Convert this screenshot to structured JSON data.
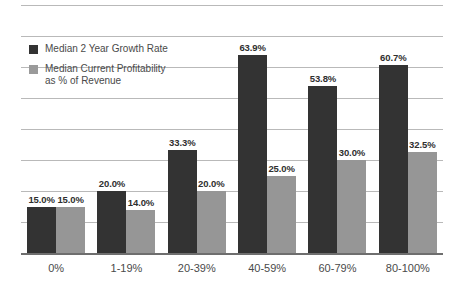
{
  "chart_data": {
    "type": "bar",
    "title": "",
    "subtitle": "",
    "xlabel": "",
    "ylabel": "",
    "ylim": [
      0,
      80
    ],
    "grid": true,
    "gridline_step": 10,
    "gridline_count": 8,
    "y_tick_labels_visible": false,
    "legend_position": "inside-top-left",
    "categories": [
      "0%",
      "1-19%",
      "20-39%",
      "40-59%",
      "60-79%",
      "80-100%"
    ],
    "series": [
      {
        "name": "Median 2 Year Growth Rate",
        "color": "#333333",
        "values": [
          15.0,
          20.0,
          33.3,
          63.9,
          53.8,
          60.7
        ],
        "value_labels": [
          "15.0%",
          "20.0%",
          "33.3%",
          "63.9%",
          "53.8%",
          "60.7%"
        ]
      },
      {
        "name": "Median Current Profitability\nas % of Revenue",
        "color": "#969696",
        "values": [
          15.0,
          14.0,
          20.0,
          25.0,
          30.0,
          32.5
        ],
        "value_labels": [
          "15.0%",
          "14.0%",
          "20.0%",
          "25.0%",
          "30.0%",
          "32.5%"
        ]
      }
    ]
  },
  "legend": {
    "items": [
      {
        "label": "Median 2 Year Growth Rate",
        "color": "#333333"
      },
      {
        "label": "Median Current Profitability\nas % of Revenue",
        "color": "#9a9a9a"
      }
    ]
  },
  "colors": {
    "series_dark": "#333333",
    "series_light": "#969696",
    "gridline": "#b9b9b9",
    "axis": "#6e6e6e",
    "background": "#ffffff",
    "text": "#4a4a4a"
  }
}
